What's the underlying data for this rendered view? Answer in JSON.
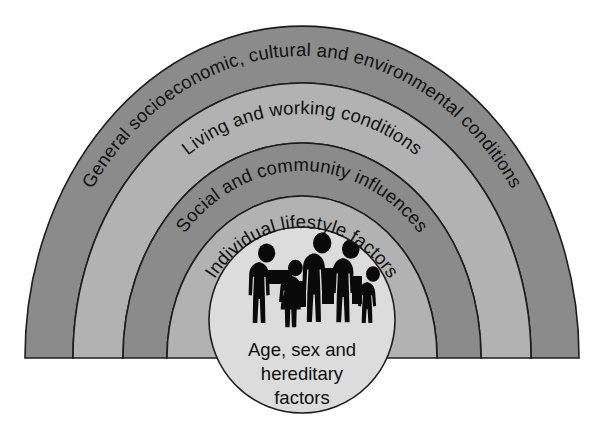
{
  "figure": {
    "name": "dahlgren-whitehead-rainbow-model",
    "background_color": "#ffffff"
  },
  "palette": {
    "band_dark": "#8b8b8b",
    "band_light": "#b2b2b2",
    "core_fill": "#dcdcdc",
    "outline": "#1d1d1d",
    "silhouette": "#0a0a0a",
    "text": "#101010"
  },
  "layout": {
    "center_x": 302,
    "baseline_y": 358,
    "apex_y": 27,
    "band_radii_x": [
      277,
      229,
      179,
      135,
      84
    ],
    "band_radii_y": [
      331,
      274,
      214,
      161,
      100
    ],
    "core_circle": {
      "cx": 302,
      "cy": 320,
      "r": 94
    }
  },
  "arcs": [
    {
      "id": "arc-outer",
      "label": "General socioeconomic, cultural and environmental conditions",
      "shade": "dark",
      "level": 1
    },
    {
      "id": "arc-second",
      "label": "Living and working conditions",
      "shade": "light",
      "level": 2
    },
    {
      "id": "arc-third",
      "label": "Social and community influences",
      "shade": "dark",
      "level": 3
    },
    {
      "id": "arc-inner",
      "label": "Individual lifestyle factors",
      "shade": "light",
      "level": 4
    }
  ],
  "core": {
    "id": "core-circle",
    "lines": [
      "Age, sex and",
      "hereditary",
      "factors"
    ],
    "icon": "family-silhouette-icon",
    "figure_count": 5
  }
}
